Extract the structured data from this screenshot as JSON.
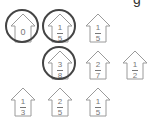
{
  "header": {
    "cut_text": "g"
  },
  "houses": [
    {
      "row": 1,
      "col": 1,
      "value": "0",
      "num": "",
      "den": "",
      "circled": true
    },
    {
      "row": 1,
      "col": 2,
      "num": "1",
      "den": "5",
      "circled": true
    },
    {
      "row": 1,
      "col": 3,
      "num": "1",
      "den": "5",
      "circled": false
    },
    {
      "row": 2,
      "col": 2,
      "num": "3",
      "den": "8",
      "circled": true
    },
    {
      "row": 2,
      "col": 3,
      "num": "2",
      "den": "7",
      "circled": false
    },
    {
      "row": 2,
      "col": 4,
      "num": "1",
      "den": "2",
      "circled": false
    },
    {
      "row": 3,
      "col": 1,
      "num": "1",
      "den": "3",
      "circled": false
    },
    {
      "row": 3,
      "col": 2,
      "num": "2",
      "den": "5",
      "circled": false
    },
    {
      "row": 3,
      "col": 3,
      "num": "1",
      "den": "5",
      "circled": false
    }
  ],
  "colors": {
    "house_outline": "#9a9a9a",
    "circle": "#444444",
    "text": "#777777"
  }
}
